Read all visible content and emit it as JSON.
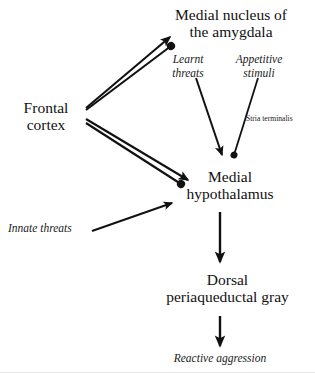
{
  "diagram": {
    "background_color": "#ffffff",
    "stroke_color": "#111111",
    "nodes": {
      "frontal_cortex": {
        "line1": "Frontal",
        "line2": "cortex"
      },
      "medial_amygdala": {
        "line1": "Medial nucleus of",
        "line2": "the amygdala"
      },
      "medial_hypothalamus": {
        "line1": "Medial",
        "line2": "hypothalamus"
      },
      "dorsal_pag": {
        "line1": "Dorsal",
        "line2": "periaqueductal gray"
      }
    },
    "annotations": {
      "learnt_threats": {
        "line1": "Learnt",
        "line2": "threats"
      },
      "appetitive_stimuli": {
        "line1": "Appetitive",
        "line2": "stimuli"
      },
      "innate_threats": {
        "line1": "Innate threats"
      },
      "reactive_aggression": {
        "line1": "Reactive aggression"
      }
    },
    "tracts": {
      "stria_terminalis": "Stria terminalis"
    },
    "edges": [
      {
        "from": "frontal_cortex",
        "to": "medial_amygdala",
        "terminal": "arrow"
      },
      {
        "from": "frontal_cortex",
        "to": "medial_amygdala",
        "terminal": "circle"
      },
      {
        "from": "frontal_cortex",
        "to": "medial_hypothalamus",
        "terminal": "arrow"
      },
      {
        "from": "frontal_cortex",
        "to": "medial_hypothalamus",
        "terminal": "circle"
      },
      {
        "from": "learnt_threats",
        "to": "medial_hypothalamus",
        "terminal": "arrow"
      },
      {
        "from": "appetitive_stimuli",
        "to": "medial_hypothalamus",
        "terminal": "circle"
      },
      {
        "from": "innate_threats",
        "to": "medial_hypothalamus",
        "terminal": "arrow"
      },
      {
        "from": "medial_hypothalamus",
        "to": "dorsal_pag",
        "terminal": "arrow"
      },
      {
        "from": "dorsal_pag",
        "to": "reactive_aggression",
        "terminal": "arrow"
      }
    ]
  }
}
